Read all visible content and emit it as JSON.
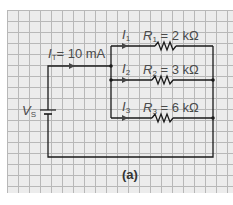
{
  "diagram": {
    "type": "parallel-circuit",
    "caption": "(a)",
    "source": {
      "symbol": "V",
      "subscript": "S"
    },
    "total_current": {
      "symbol": "I",
      "subscript": "T",
      "value": "= 10 mA"
    },
    "branches": [
      {
        "current_symbol": "I",
        "current_subscript": "1",
        "resistor_symbol": "R",
        "resistor_subscript": "1",
        "resistor_value": " = 2 kΩ"
      },
      {
        "current_symbol": "I",
        "current_subscript": "2",
        "resistor_symbol": "R",
        "resistor_subscript": "2",
        "resistor_value": " = 3 kΩ"
      },
      {
        "current_symbol": "I",
        "current_subscript": "3",
        "resistor_symbol": "R",
        "resistor_subscript": "3",
        "resistor_value": " = 6 kΩ"
      }
    ],
    "colors": {
      "wire": "#1a1a1a",
      "grid_bg": "#ececec",
      "grid_line": "#b8b8b8",
      "label": "#4a4a4a"
    }
  }
}
